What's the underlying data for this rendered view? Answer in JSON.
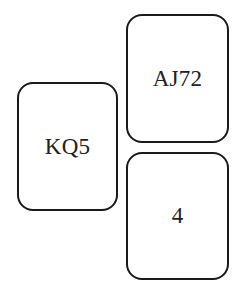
{
  "hands": {
    "north": {
      "cards": "AJ72"
    },
    "west": {
      "cards": "KQ5"
    },
    "south": {
      "cards": "4"
    }
  },
  "colors": {
    "border": "#1a1a1a",
    "text": "#222222",
    "background": "#ffffff"
  }
}
